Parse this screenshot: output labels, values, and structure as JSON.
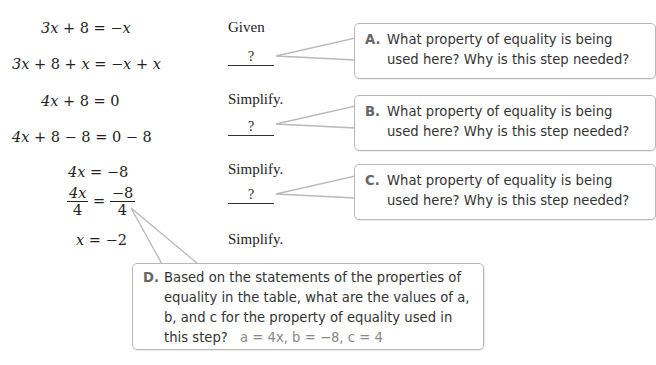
{
  "proof": {
    "steps": [
      {
        "statement": "3x + 8 = −x",
        "reason": "Given"
      },
      {
        "statement": "3x + 8 + x = −x + x",
        "reason": "?"
      },
      {
        "statement": "4x + 8 = 0",
        "reason": "Simplify."
      },
      {
        "statement": "4x + 8 − 8 = 0 − 8",
        "reason": "?"
      },
      {
        "statement": "4x = −8",
        "reason": "Simplify."
      },
      {
        "statement": "4x/4 = −8/4",
        "reason": "?",
        "frac": {
          "lhs_num": "4x",
          "lhs_den": "4",
          "rhs_num": "−8",
          "rhs_den": "4"
        }
      },
      {
        "statement": "x = −2",
        "reason": "Simplify."
      }
    ]
  },
  "callouts": {
    "a": {
      "letter": "A.",
      "line1": "What property of equality is being",
      "line2": "used here? Why is this step needed?"
    },
    "b": {
      "letter": "B.",
      "line1": "What property of equality is being",
      "line2": "used here? Why is this step needed?"
    },
    "c": {
      "letter": "C.",
      "line1": "What property of equality is being",
      "line2": "used here? Why is this step needed?"
    },
    "d": {
      "letter": "D.",
      "line1": "Based on the statements of the properties of",
      "line2": "equality in the table, what are the values of a,",
      "line3": "b, and c for the property of equality used in",
      "line4": "this step?",
      "answer": "a = 4x, b = −8, c = 4"
    }
  },
  "colors": {
    "border": "#b9b9b9",
    "letter": "#666666",
    "answer": "#888888"
  }
}
